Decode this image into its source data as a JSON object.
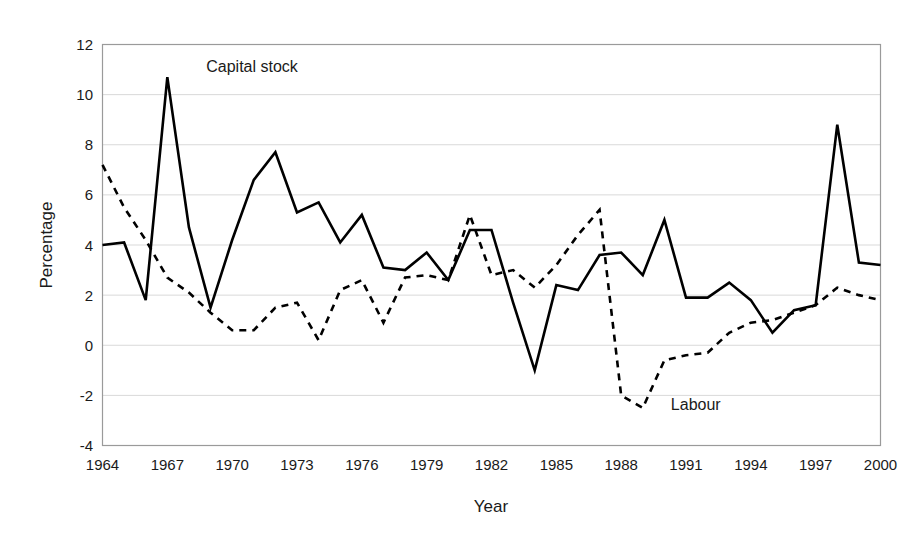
{
  "chart_data": {
    "type": "line",
    "title": "",
    "xlabel": "Year",
    "ylabel": "Percentage",
    "xlim": [
      1964,
      2000
    ],
    "ylim": [
      -4,
      12
    ],
    "grid": true,
    "grid_axis": "y",
    "legend": "inline-annotations",
    "y_ticks": [
      12,
      10,
      8,
      6,
      4,
      2,
      0,
      -2,
      -4
    ],
    "y_tick_labels": [
      "12",
      "10",
      "8",
      "6",
      "4",
      "2",
      "0",
      "-2",
      "-4"
    ],
    "x_ticks": [
      1964,
      1967,
      1970,
      1973,
      1976,
      1979,
      1982,
      1985,
      1988,
      1991,
      1994,
      1997,
      2000
    ],
    "x_tick_labels": [
      "1964",
      "1967",
      "1970",
      "1973",
      "1976",
      "1979",
      "1982",
      "1985",
      "1988",
      "1991",
      "1994",
      "1997",
      "2000"
    ],
    "x": [
      1964,
      1965,
      1966,
      1967,
      1968,
      1969,
      1970,
      1971,
      1972,
      1973,
      1974,
      1975,
      1976,
      1977,
      1978,
      1979,
      1980,
      1981,
      1982,
      1983,
      1984,
      1985,
      1986,
      1987,
      1988,
      1989,
      1990,
      1991,
      1992,
      1993,
      1994,
      1995,
      1996,
      1997,
      1998,
      1999,
      2000
    ],
    "series": [
      {
        "name": "Capital stock",
        "style": "solid",
        "color": "#000000",
        "linewidth": 2.6,
        "annotation": {
          "text": "Capital stock",
          "x": 1968.8,
          "y": 10.9
        },
        "values": [
          4.0,
          4.1,
          1.8,
          10.7,
          4.7,
          1.5,
          4.2,
          6.6,
          7.7,
          5.3,
          5.7,
          4.1,
          5.2,
          3.1,
          3.0,
          3.7,
          2.6,
          4.6,
          4.6,
          1.7,
          -1.0,
          2.4,
          2.2,
          3.6,
          3.7,
          2.8,
          5.0,
          1.9,
          1.9,
          2.5,
          1.8,
          0.5,
          1.4,
          1.6,
          8.8,
          3.3,
          3.2
        ]
      },
      {
        "name": "Labour",
        "style": "dashed",
        "color": "#000000",
        "linewidth": 2.6,
        "dasharray": "7 6",
        "annotation": {
          "text": "Labour",
          "x": 1990.3,
          "y": -2.6
        },
        "values": [
          7.2,
          5.5,
          4.2,
          2.7,
          2.1,
          1.3,
          0.6,
          0.6,
          1.5,
          1.7,
          0.2,
          2.2,
          2.6,
          0.9,
          2.7,
          2.8,
          2.6,
          5.2,
          2.8,
          3.0,
          2.3,
          3.2,
          4.4,
          5.4,
          -2.0,
          -2.5,
          -0.6,
          -0.4,
          -0.3,
          0.5,
          0.9,
          1.0,
          1.3,
          1.6,
          2.3,
          2.0,
          1.8
        ]
      }
    ]
  },
  "colors": {
    "plot_border": "#9a9a9a",
    "gridline": "#d9d9d9",
    "line": "#000000",
    "text": "#1a1a1a",
    "background": "#ffffff"
  }
}
